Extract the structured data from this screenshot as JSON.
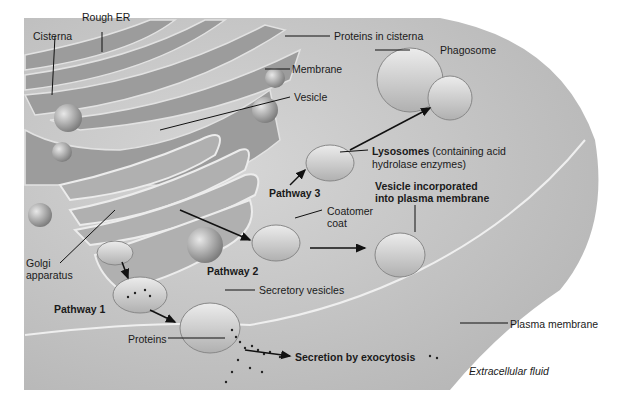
{
  "diagram": {
    "labels": {
      "rough_er": "Rough ER",
      "cisterna": "Cisterna",
      "proteins_in_cisterna": "Proteins in cisterna",
      "membrane": "Membrane",
      "vesicle": "Vesicle",
      "phagosome": "Phagosome",
      "lysosomes_bold": "Lysosomes",
      "lysosomes_rest": " (containing acid",
      "lysosomes_line2": "hydrolase enzymes)",
      "pathway3": "Pathway 3",
      "vesicle_incorporated_1": "Vesicle incorporated",
      "vesicle_incorporated_2": "into plasma membrane",
      "coatomer_1": "Coatomer",
      "coatomer_2": "coat",
      "golgi_1": "Golgi",
      "golgi_2": "apparatus",
      "pathway2": "Pathway 2",
      "secretory_vesicles": "Secretory vesicles",
      "pathway1": "Pathway 1",
      "proteins": "Proteins",
      "secretion": "Secretion by exocytosis",
      "plasma_membrane": "Plasma membrane",
      "extracellular_fluid": "Extracellular fluid"
    },
    "colors": {
      "cell_bg": "#c8c8c8",
      "organelle": "#a8a8a8",
      "vesicle": "#d8d8d8",
      "line": "#111111"
    }
  }
}
